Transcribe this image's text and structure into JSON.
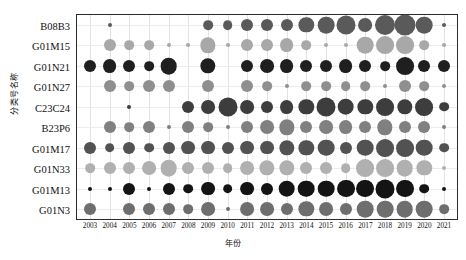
{
  "chart_data": {
    "type": "scatter",
    "title": "",
    "xlabel": "年份",
    "ylabel": "分类号名称",
    "grid": true,
    "legend": "none",
    "colorscale": "grayscale",
    "categories_x": [
      "2003",
      "2004",
      "2005",
      "2006",
      "2007",
      "2008",
      "2009",
      "2010",
      "2011",
      "2012",
      "2013",
      "2014",
      "2015",
      "2016",
      "2017",
      "2018",
      "2019",
      "2020",
      "2021"
    ],
    "categories_y": [
      "B08B3",
      "G01M15",
      "G01N21",
      "G01N27",
      "C23C24",
      "B23P6",
      "G01M17",
      "G01N33",
      "G01M13",
      "G01N3"
    ],
    "size_encodes": "count",
    "series": [
      {
        "name": "B08B3",
        "color": "#5a5a5a",
        "points": [
          {
            "x": "2004",
            "v": 2
          },
          {
            "x": "2009",
            "v": 3
          },
          {
            "x": "2010",
            "v": 3
          },
          {
            "x": "2011",
            "v": 4
          },
          {
            "x": "2012",
            "v": 4
          },
          {
            "x": "2013",
            "v": 4
          },
          {
            "x": "2014",
            "v": 6
          },
          {
            "x": "2015",
            "v": 7
          },
          {
            "x": "2016",
            "v": 9
          },
          {
            "x": "2017",
            "v": 5
          },
          {
            "x": "2018",
            "v": 10
          },
          {
            "x": "2019",
            "v": 11
          },
          {
            "x": "2020",
            "v": 7
          },
          {
            "x": "2021",
            "v": 2
          }
        ]
      },
      {
        "name": "G01M15",
        "color": "#a8a8a8",
        "points": [
          {
            "x": "2004",
            "v": 4
          },
          {
            "x": "2005",
            "v": 3
          },
          {
            "x": "2006",
            "v": 3
          },
          {
            "x": "2007",
            "v": 2
          },
          {
            "x": "2008",
            "v": 2
          },
          {
            "x": "2009",
            "v": 6
          },
          {
            "x": "2010",
            "v": 2
          },
          {
            "x": "2011",
            "v": 4
          },
          {
            "x": "2012",
            "v": 4
          },
          {
            "x": "2013",
            "v": 5
          },
          {
            "x": "2014",
            "v": 3
          },
          {
            "x": "2015",
            "v": 2
          },
          {
            "x": "2016",
            "v": 2
          },
          {
            "x": "2017",
            "v": 7
          },
          {
            "x": "2018",
            "v": 8
          },
          {
            "x": "2019",
            "v": 8
          },
          {
            "x": "2020",
            "v": 3
          },
          {
            "x": "2021",
            "v": 2
          }
        ]
      },
      {
        "name": "G01N21",
        "color": "#1f1f1f",
        "points": [
          {
            "x": "2003",
            "v": 4
          },
          {
            "x": "2004",
            "v": 5
          },
          {
            "x": "2005",
            "v": 4
          },
          {
            "x": "2006",
            "v": 3
          },
          {
            "x": "2007",
            "v": 7
          },
          {
            "x": "2009",
            "v": 6
          },
          {
            "x": "2011",
            "v": 4
          },
          {
            "x": "2012",
            "v": 5
          },
          {
            "x": "2013",
            "v": 5
          },
          {
            "x": "2014",
            "v": 4
          },
          {
            "x": "2015",
            "v": 4
          },
          {
            "x": "2016",
            "v": 5
          },
          {
            "x": "2017",
            "v": 4
          },
          {
            "x": "2018",
            "v": 3
          },
          {
            "x": "2019",
            "v": 8
          },
          {
            "x": "2020",
            "v": 4
          },
          {
            "x": "2021",
            "v": 4
          }
        ]
      },
      {
        "name": "G01N27",
        "color": "#8f8f8f",
        "points": [
          {
            "x": "2004",
            "v": 4
          },
          {
            "x": "2005",
            "v": 3
          },
          {
            "x": "2006",
            "v": 4
          },
          {
            "x": "2007",
            "v": 4
          },
          {
            "x": "2009",
            "v": 4
          },
          {
            "x": "2011",
            "v": 4
          },
          {
            "x": "2012",
            "v": 3
          },
          {
            "x": "2013",
            "v": 2
          },
          {
            "x": "2014",
            "v": 3
          },
          {
            "x": "2015",
            "v": 3
          },
          {
            "x": "2016",
            "v": 3
          },
          {
            "x": "2017",
            "v": 3
          },
          {
            "x": "2018",
            "v": 2
          },
          {
            "x": "2019",
            "v": 4
          },
          {
            "x": "2020",
            "v": 3
          },
          {
            "x": "2021",
            "v": 2
          }
        ]
      },
      {
        "name": "C23C24",
        "color": "#3d3d3d",
        "points": [
          {
            "x": "2005",
            "v": 2
          },
          {
            "x": "2008",
            "v": 4
          },
          {
            "x": "2009",
            "v": 5
          },
          {
            "x": "2010",
            "v": 9
          },
          {
            "x": "2011",
            "v": 5
          },
          {
            "x": "2012",
            "v": 4
          },
          {
            "x": "2013",
            "v": 5
          },
          {
            "x": "2014",
            "v": 6
          },
          {
            "x": "2015",
            "v": 9
          },
          {
            "x": "2016",
            "v": 7
          },
          {
            "x": "2017",
            "v": 6
          },
          {
            "x": "2018",
            "v": 8
          },
          {
            "x": "2019",
            "v": 6
          },
          {
            "x": "2020",
            "v": 8
          },
          {
            "x": "2021",
            "v": 3
          }
        ]
      },
      {
        "name": "B23P6",
        "color": "#808080",
        "points": [
          {
            "x": "2004",
            "v": 4
          },
          {
            "x": "2005",
            "v": 3
          },
          {
            "x": "2006",
            "v": 4
          },
          {
            "x": "2007",
            "v": 2
          },
          {
            "x": "2008",
            "v": 4
          },
          {
            "x": "2009",
            "v": 3
          },
          {
            "x": "2010",
            "v": 2
          },
          {
            "x": "2011",
            "v": 4
          },
          {
            "x": "2012",
            "v": 5
          },
          {
            "x": "2013",
            "v": 6
          },
          {
            "x": "2014",
            "v": 4
          },
          {
            "x": "2015",
            "v": 5
          },
          {
            "x": "2016",
            "v": 5
          },
          {
            "x": "2017",
            "v": 4
          },
          {
            "x": "2018",
            "v": 6
          },
          {
            "x": "2019",
            "v": 4
          },
          {
            "x": "2020",
            "v": 4
          },
          {
            "x": "2021",
            "v": 2
          }
        ]
      },
      {
        "name": "G01M17",
        "color": "#525252",
        "points": [
          {
            "x": "2003",
            "v": 4
          },
          {
            "x": "2004",
            "v": 3
          },
          {
            "x": "2005",
            "v": 4
          },
          {
            "x": "2006",
            "v": 3
          },
          {
            "x": "2007",
            "v": 4
          },
          {
            "x": "2008",
            "v": 5
          },
          {
            "x": "2009",
            "v": 5
          },
          {
            "x": "2010",
            "v": 4
          },
          {
            "x": "2011",
            "v": 5
          },
          {
            "x": "2012",
            "v": 5
          },
          {
            "x": "2013",
            "v": 6
          },
          {
            "x": "2014",
            "v": 6
          },
          {
            "x": "2015",
            "v": 7
          },
          {
            "x": "2016",
            "v": 4
          },
          {
            "x": "2017",
            "v": 7
          },
          {
            "x": "2018",
            "v": 8
          },
          {
            "x": "2019",
            "v": 8
          },
          {
            "x": "2020",
            "v": 7
          },
          {
            "x": "2021",
            "v": 3
          }
        ]
      },
      {
        "name": "G01N33",
        "color": "#b0b0b0",
        "points": [
          {
            "x": "2003",
            "v": 3
          },
          {
            "x": "2004",
            "v": 4
          },
          {
            "x": "2005",
            "v": 4
          },
          {
            "x": "2006",
            "v": 5
          },
          {
            "x": "2007",
            "v": 7
          },
          {
            "x": "2008",
            "v": 4
          },
          {
            "x": "2009",
            "v": 4
          },
          {
            "x": "2010",
            "v": 3
          },
          {
            "x": "2011",
            "v": 5
          },
          {
            "x": "2012",
            "v": 6
          },
          {
            "x": "2013",
            "v": 6
          },
          {
            "x": "2014",
            "v": 4
          },
          {
            "x": "2015",
            "v": 4
          },
          {
            "x": "2016",
            "v": 3
          },
          {
            "x": "2017",
            "v": 8
          },
          {
            "x": "2018",
            "v": 8
          },
          {
            "x": "2019",
            "v": 7
          },
          {
            "x": "2020",
            "v": 6
          },
          {
            "x": "2021",
            "v": 2
          }
        ]
      },
      {
        "name": "G01M13",
        "color": "#141414",
        "points": [
          {
            "x": "2003",
            "v": 2
          },
          {
            "x": "2004",
            "v": 2
          },
          {
            "x": "2005",
            "v": 4
          },
          {
            "x": "2006",
            "v": 2
          },
          {
            "x": "2007",
            "v": 4
          },
          {
            "x": "2008",
            "v": 3
          },
          {
            "x": "2009",
            "v": 5
          },
          {
            "x": "2010",
            "v": 3
          },
          {
            "x": "2011",
            "v": 5
          },
          {
            "x": "2012",
            "v": 4
          },
          {
            "x": "2013",
            "v": 7
          },
          {
            "x": "2014",
            "v": 7
          },
          {
            "x": "2015",
            "v": 7
          },
          {
            "x": "2016",
            "v": 8
          },
          {
            "x": "2017",
            "v": 8
          },
          {
            "x": "2018",
            "v": 9
          },
          {
            "x": "2019",
            "v": 8
          },
          {
            "x": "2020",
            "v": 3
          },
          {
            "x": "2021",
            "v": 2
          }
        ]
      },
      {
        "name": "G01N3",
        "color": "#6e6e6e",
        "points": [
          {
            "x": "2003",
            "v": 4
          },
          {
            "x": "2005",
            "v": 4
          },
          {
            "x": "2006",
            "v": 4
          },
          {
            "x": "2007",
            "v": 4
          },
          {
            "x": "2008",
            "v": 3
          },
          {
            "x": "2009",
            "v": 5
          },
          {
            "x": "2010",
            "v": 2
          },
          {
            "x": "2011",
            "v": 5
          },
          {
            "x": "2012",
            "v": 5
          },
          {
            "x": "2013",
            "v": 4
          },
          {
            "x": "2014",
            "v": 6
          },
          {
            "x": "2015",
            "v": 5
          },
          {
            "x": "2016",
            "v": 4
          },
          {
            "x": "2017",
            "v": 7
          },
          {
            "x": "2018",
            "v": 7
          },
          {
            "x": "2019",
            "v": 7
          },
          {
            "x": "2020",
            "v": 7
          },
          {
            "x": "2021",
            "v": 3
          }
        ]
      }
    ]
  }
}
